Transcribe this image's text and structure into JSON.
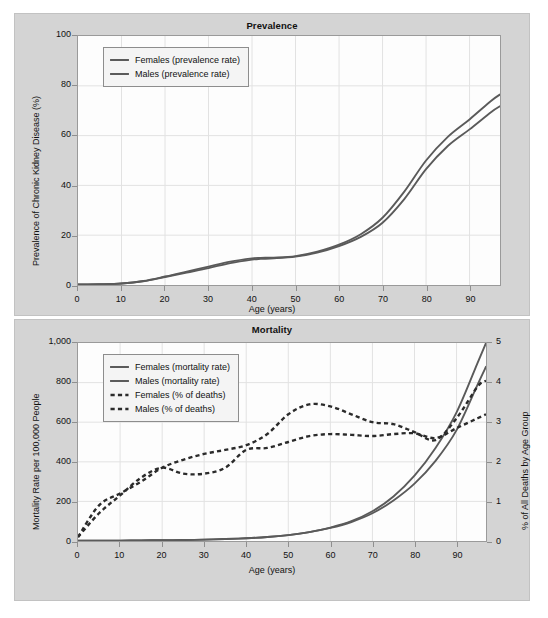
{
  "figure": {
    "background_color": "#ffffff",
    "panel_color": "#d4d4d4",
    "plot_color": "#fdfdfd",
    "grid_color": "#e2e2e2",
    "solid_series_color": "#5a5a5a",
    "dashed_series_color": "#2b2b2b"
  },
  "chart_data": [
    {
      "type": "line",
      "title": "Prevalence",
      "xlabel": "Age (years)",
      "ylabel": "Prevalence of Chronic Kidney Disease (%)",
      "xlim": [
        0,
        97
      ],
      "ylim": [
        0,
        100
      ],
      "xticks": [
        0,
        10,
        20,
        30,
        40,
        50,
        60,
        70,
        80,
        90
      ],
      "yticks": [
        0,
        20,
        40,
        60,
        80,
        100
      ],
      "xticklabels": [
        "0",
        "10",
        "20",
        "30",
        "40",
        "50",
        "60",
        "70",
        "80",
        "90"
      ],
      "yticklabels": [
        "0",
        "20",
        "40",
        "60",
        "80",
        "100"
      ],
      "grid": true,
      "legend_position": "upper left",
      "x": [
        0,
        5,
        10,
        15,
        20,
        25,
        30,
        35,
        40,
        42,
        45,
        50,
        55,
        60,
        65,
        70,
        75,
        80,
        85,
        90,
        95,
        97
      ],
      "series": [
        {
          "name": "Females (prevalence rate)",
          "style": "solid",
          "values": [
            0.2,
            0.3,
            0.6,
            1.6,
            3.4,
            5.4,
            7.4,
            9.4,
            10.7,
            10.9,
            11.0,
            11.6,
            13.4,
            16.2,
            20.4,
            27.0,
            37.5,
            50.0,
            59.5,
            66.5,
            74.0,
            76.5
          ]
        },
        {
          "name": "Males (prevalence rate)",
          "style": "solid",
          "values": [
            0.2,
            0.3,
            0.6,
            1.5,
            3.2,
            5.0,
            6.8,
            8.8,
            10.2,
            10.5,
            10.7,
            11.4,
            13.0,
            15.6,
            19.3,
            25.0,
            34.5,
            46.5,
            55.8,
            62.5,
            69.5,
            71.8
          ]
        }
      ]
    },
    {
      "type": "line",
      "title": "Mortality",
      "xlabel": "Age (years)",
      "ylabel": "Mortality Rate per 100,000 People",
      "ylabel_right": "% of All Deaths by Age Group",
      "xlim": [
        0,
        97
      ],
      "ylim": [
        0,
        1000
      ],
      "ylim_right": [
        0,
        5
      ],
      "xticks": [
        0,
        10,
        20,
        30,
        40,
        50,
        60,
        70,
        80,
        90
      ],
      "yticks": [
        0,
        200,
        400,
        600,
        800,
        1000
      ],
      "yticks_right": [
        0,
        1,
        2,
        3,
        4,
        5
      ],
      "xticklabels": [
        "0",
        "10",
        "20",
        "30",
        "40",
        "50",
        "60",
        "70",
        "80",
        "90"
      ],
      "yticklabels": [
        "0",
        "200",
        "400",
        "600",
        "800",
        "1,000"
      ],
      "yticklabels_right": [
        "0",
        "1",
        "2",
        "3",
        "4",
        "5"
      ],
      "grid": true,
      "legend_position": "upper left",
      "x": [
        0,
        5,
        10,
        15,
        20,
        25,
        30,
        35,
        40,
        45,
        50,
        55,
        60,
        65,
        70,
        75,
        80,
        85,
        90,
        95,
        97
      ],
      "series": [
        {
          "name": "Females (mortality rate)",
          "style": "solid",
          "axis": "left",
          "values": [
            2,
            2,
            2,
            3,
            4,
            5,
            7,
            10,
            14,
            20,
            30,
            45,
            68,
            100,
            150,
            225,
            330,
            470,
            650,
            900,
            1000
          ]
        },
        {
          "name": "Males (mortality rate)",
          "style": "solid",
          "axis": "left",
          "values": [
            2,
            2,
            2,
            3,
            4,
            5,
            7,
            10,
            14,
            20,
            30,
            45,
            66,
            96,
            140,
            205,
            290,
            405,
            560,
            790,
            880
          ]
        },
        {
          "name": "Females (% of deaths)",
          "style": "dashed",
          "axis": "right",
          "values": [
            0.1,
            0.9,
            1.2,
            1.5,
            1.85,
            2.05,
            2.2,
            2.3,
            2.42,
            2.7,
            3.2,
            3.45,
            3.4,
            3.2,
            3.0,
            2.95,
            2.75,
            2.55,
            3.1,
            3.9,
            4.05
          ]
        },
        {
          "name": "Males (% of deaths)",
          "style": "dashed",
          "axis": "right",
          "values": [
            0.1,
            0.7,
            1.15,
            1.6,
            1.85,
            1.7,
            1.7,
            1.85,
            2.3,
            2.35,
            2.5,
            2.65,
            2.7,
            2.68,
            2.65,
            2.7,
            2.72,
            2.6,
            2.85,
            3.1,
            3.2
          ]
        }
      ]
    }
  ],
  "prevalence": {
    "title": "Prevalence",
    "axis_x_title": "Age (years)",
    "axis_y_title": "Prevalence of Chronic Kidney Disease (%)",
    "yticks": [
      "100",
      "80",
      "60",
      "40",
      "20",
      "0"
    ],
    "xticks": [
      "0",
      "10",
      "20",
      "30",
      "40",
      "50",
      "60",
      "70",
      "80",
      "90"
    ],
    "legend": [
      {
        "label": "Females (prevalence rate)",
        "style": "solid"
      },
      {
        "label": "Males (prevalence rate)",
        "style": "solid"
      }
    ]
  },
  "mortality": {
    "title": "Mortality",
    "axis_x_title": "Age (years)",
    "axis_y_title": "Mortality Rate per 100,000 People",
    "axis_y2_title": "% of All Deaths by Age Group",
    "yticks": [
      "1,000",
      "800",
      "600",
      "400",
      "200",
      "0"
    ],
    "yticks_right": [
      "5",
      "4",
      "3",
      "2",
      "1",
      "0"
    ],
    "xticks": [
      "0",
      "10",
      "20",
      "30",
      "40",
      "50",
      "60",
      "70",
      "80",
      "90"
    ],
    "legend": [
      {
        "label": "Females (mortality rate)",
        "style": "solid"
      },
      {
        "label": "Males (mortality rate)",
        "style": "solid"
      },
      {
        "label": "Females (% of deaths)",
        "style": "dashed"
      },
      {
        "label": "Males (% of deaths)",
        "style": "dashed"
      }
    ]
  }
}
